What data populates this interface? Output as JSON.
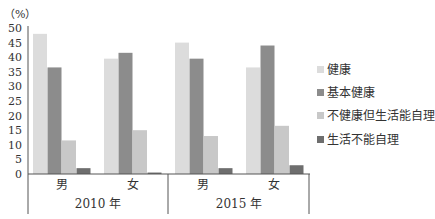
{
  "chart_data": {
    "type": "bar",
    "title": "",
    "ylabel": "（%）",
    "xlabel": "",
    "ylim": [
      0,
      50
    ],
    "yticks": [
      0,
      5,
      10,
      15,
      20,
      25,
      30,
      35,
      40,
      45,
      50
    ],
    "grid": false,
    "legend_position": "right",
    "groups": [
      {
        "label": "2010 年",
        "categories": [
          "男",
          "女"
        ]
      },
      {
        "label": "2015 年",
        "categories": [
          "男",
          "女"
        ]
      }
    ],
    "categories": [
      "2010 年 男",
      "2010 年 女",
      "2015 年 男",
      "2015 年 女"
    ],
    "series": [
      {
        "name": "健康",
        "color": "#dcdcdc",
        "values": [
          48,
          39.5,
          45,
          36.5
        ]
      },
      {
        "name": "基本健康",
        "color": "#8c8c8c",
        "values": [
          36.5,
          41.5,
          39.5,
          44
        ]
      },
      {
        "name": "不健康但生活能自理",
        "color": "#c8c8c8",
        "values": [
          11.5,
          15,
          13,
          16.5
        ]
      },
      {
        "name": "生活不能自理",
        "color": "#6e6e6e",
        "values": [
          2,
          0.5,
          2,
          3
        ]
      }
    ]
  }
}
